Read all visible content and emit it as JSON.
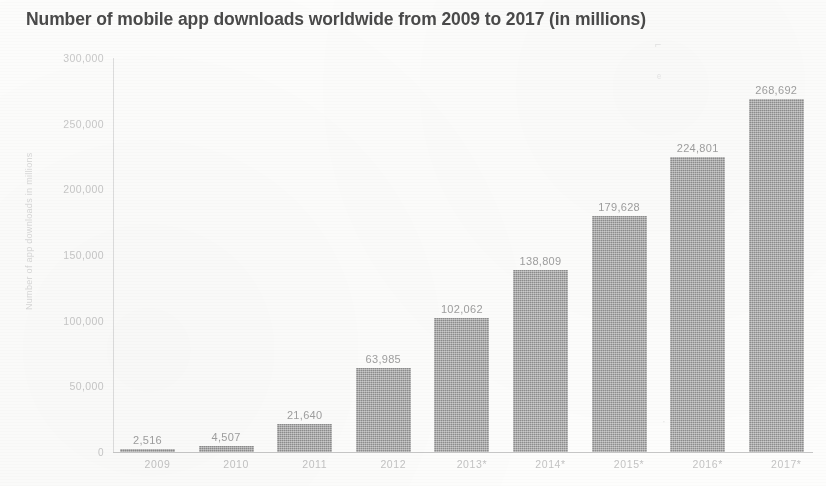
{
  "chart_data": {
    "type": "bar",
    "title": "Number of mobile app downloads worldwide from 2009 to 2017 (in millions)",
    "xlabel": "",
    "ylabel": "Number of app downloads in millions",
    "ylim": [
      0,
      300000
    ],
    "grid": false,
    "legend": "none",
    "categories": [
      "2009",
      "2010",
      "2011",
      "2012",
      "2013*",
      "2014*",
      "2015*",
      "2016*",
      "2017*"
    ],
    "values": [
      2516,
      4507,
      21640,
      63985,
      102062,
      138809,
      179628,
      224801,
      268692
    ],
    "value_labels": [
      "2,516",
      "4,507",
      "21,640",
      "63,985",
      "102,062",
      "138,809",
      "179,628",
      "224,801",
      "268,692"
    ],
    "y_ticks": [
      0,
      50000,
      100000,
      150000,
      200000,
      250000,
      300000
    ],
    "y_tick_labels": [
      "0",
      "50,000",
      "100,000",
      "150,000",
      "200,000",
      "250,000",
      "300,000"
    ],
    "bar_color": "#9b9b9b",
    "title_color": "#4a4a4a",
    "label_color": "#9f9f9f",
    "axis_color": "#c8c8c8"
  }
}
